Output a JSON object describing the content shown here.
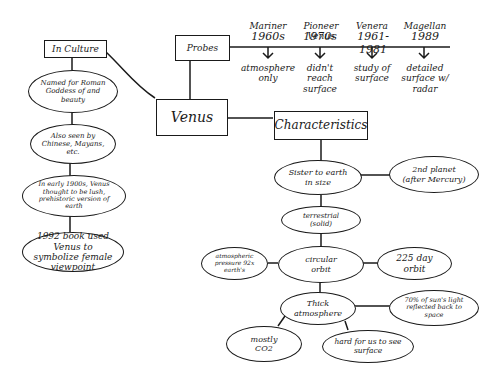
{
  "diagram": {
    "type": "concept-map",
    "central": "Venus",
    "culture": {
      "title": "In Culture",
      "items": [
        "Named for Roman Goddess of and beauty",
        "Also seen by Chinese, Mayans, etc.",
        "In early 1900s, Venus thought to be lush, prehistoric version of earth",
        "1992 book used Venus to symbolize female viewpoint"
      ]
    },
    "probes": {
      "title": "Probes",
      "timeline": [
        {
          "name": "Mariner",
          "date": "1960s",
          "note": "atmosphere only"
        },
        {
          "name": "Pioneer Venus",
          "date": "1970s",
          "note": "didn't reach surface"
        },
        {
          "name": "Venera",
          "date": "1961-1981",
          "note": "study of surface"
        },
        {
          "name": "Magellan",
          "date": "1989",
          "note": "detailed surface w/ radar"
        }
      ]
    },
    "characteristics": {
      "title": "Characteristics",
      "sister": "Sister to earth in size",
      "second_planet": "2nd planet (after Mercury)",
      "terrestrial": "terrestrial (solid)",
      "orbit": "circular orbit",
      "orbit_days": "225 day orbit",
      "pressure": "atmospheric pressure 92x earth's",
      "atmosphere": "Thick atmosphere",
      "sunlight": "70% of sun's light reflected back to space",
      "co2": "mostly CO2",
      "surface": "hard for us to see surface"
    }
  }
}
